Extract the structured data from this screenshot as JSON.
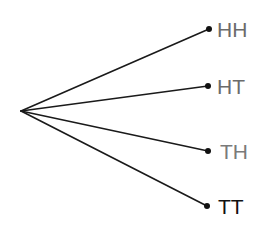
{
  "diagram": {
    "type": "tree",
    "title": "",
    "root": {
      "label": ""
    },
    "outcomes": [
      {
        "label": "HH",
        "color": "#6b6b6b"
      },
      {
        "label": "HT",
        "color": "#6b6b6b"
      },
      {
        "label": "TH",
        "color": "#7a7a7a"
      },
      {
        "label": "TT",
        "color": "#111111"
      }
    ]
  }
}
